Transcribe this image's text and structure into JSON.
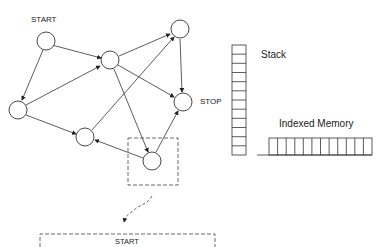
{
  "diagram": {
    "labels": {
      "start": "START",
      "stop": "STOP",
      "stack": "Stack",
      "indexed_memory": "Indexed Memory",
      "zoom_start": "START"
    },
    "nodes": [
      {
        "id": "n1",
        "x": 46,
        "y": 41,
        "label": "START"
      },
      {
        "id": "n2",
        "x": 110,
        "y": 60
      },
      {
        "id": "n3",
        "x": 180,
        "y": 29
      },
      {
        "id": "n4",
        "x": 18,
        "y": 110
      },
      {
        "id": "n5",
        "x": 183,
        "y": 102,
        "label": "STOP"
      },
      {
        "id": "n6",
        "x": 85,
        "y": 137
      },
      {
        "id": "n7",
        "x": 152,
        "y": 161
      }
    ],
    "edges": [
      [
        "n1",
        "n2"
      ],
      [
        "n1",
        "n4"
      ],
      [
        "n4",
        "n2"
      ],
      [
        "n4",
        "n6"
      ],
      [
        "n2",
        "n3"
      ],
      [
        "n2",
        "n5"
      ],
      [
        "n2",
        "n7"
      ],
      [
        "n3",
        "n5"
      ],
      [
        "n6",
        "n3"
      ],
      [
        "n7",
        "n6"
      ],
      [
        "n7",
        "n5"
      ]
    ],
    "stack_cells": 12,
    "memory_cells": 12
  }
}
